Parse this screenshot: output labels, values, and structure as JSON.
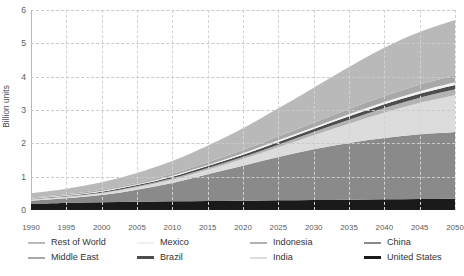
{
  "chart_data": {
    "type": "area",
    "title": "",
    "xlabel": "",
    "ylabel": "Billion units",
    "xlim": [
      1990,
      2050
    ],
    "ylim": [
      0,
      6
    ],
    "ytick_labels": [
      "0",
      "1",
      "2",
      "3",
      "4",
      "5",
      "6"
    ],
    "ytick_values": [
      0,
      1,
      2,
      3,
      4,
      5,
      6
    ],
    "x": [
      1990,
      1995,
      2000,
      2005,
      2010,
      2015,
      2020,
      2025,
      2030,
      2035,
      2040,
      2045,
      2050
    ],
    "xtick_labels": [
      "1990",
      "1995",
      "2000",
      "2005",
      "2010",
      "2015",
      "2020",
      "2025",
      "2030",
      "2035",
      "2040",
      "2045",
      "2050"
    ],
    "stacked": true,
    "grid": "dashed-both",
    "legend_position": "bottom",
    "series": [
      {
        "name": "United States",
        "color": "#1a1a1a",
        "values": [
          0.19,
          0.21,
          0.23,
          0.25,
          0.26,
          0.27,
          0.28,
          0.29,
          0.3,
          0.31,
          0.32,
          0.33,
          0.34
        ]
      },
      {
        "name": "China",
        "color": "#8a8a8a",
        "values": [
          0.09,
          0.14,
          0.22,
          0.36,
          0.55,
          0.8,
          1.05,
          1.3,
          1.52,
          1.7,
          1.84,
          1.94,
          2.0
        ]
      },
      {
        "name": "India",
        "color": "#dcdcdc",
        "values": [
          0.03,
          0.04,
          0.05,
          0.07,
          0.1,
          0.14,
          0.2,
          0.29,
          0.42,
          0.58,
          0.76,
          0.94,
          1.1
        ]
      },
      {
        "name": "Indonesia",
        "color": "#b3b3b3",
        "values": [
          0.01,
          0.02,
          0.02,
          0.03,
          0.04,
          0.05,
          0.06,
          0.08,
          0.1,
          0.12,
          0.14,
          0.16,
          0.18
        ]
      },
      {
        "name": "Brazil",
        "color": "#4d4d4d",
        "values": [
          0.02,
          0.02,
          0.03,
          0.04,
          0.05,
          0.06,
          0.07,
          0.08,
          0.09,
          0.1,
          0.11,
          0.12,
          0.13
        ]
      },
      {
        "name": "Mexico",
        "color": "#f2f2f2",
        "values": [
          0.01,
          0.01,
          0.02,
          0.02,
          0.03,
          0.03,
          0.04,
          0.05,
          0.05,
          0.06,
          0.07,
          0.07,
          0.08
        ]
      },
      {
        "name": "Middle East",
        "color": "#a8a8a8",
        "values": [
          0.02,
          0.03,
          0.04,
          0.05,
          0.06,
          0.08,
          0.1,
          0.12,
          0.14,
          0.16,
          0.18,
          0.2,
          0.22
        ]
      },
      {
        "name": "Rest of World",
        "color": "#b9b9b9",
        "values": [
          0.13,
          0.17,
          0.22,
          0.29,
          0.38,
          0.5,
          0.65,
          0.84,
          1.05,
          1.26,
          1.45,
          1.58,
          1.65
        ]
      }
    ],
    "totals": [
      0.5,
      0.64,
      0.83,
      1.11,
      1.47,
      1.93,
      2.45,
      3.05,
      3.67,
      4.29,
      4.87,
      5.34,
      5.7
    ]
  },
  "legend": {
    "columns": [
      {
        "entries": [
          {
            "label": "Rest of World",
            "color": "#b9b9b9",
            "weight": "normal"
          },
          {
            "label": "Middle East",
            "color": "#a8a8a8",
            "weight": "normal"
          }
        ]
      },
      {
        "entries": [
          {
            "label": "Mexico",
            "color": "#f0f0f0",
            "weight": "normal"
          },
          {
            "label": "Brazil",
            "color": "#4d4d4d",
            "weight": "thick"
          }
        ]
      },
      {
        "entries": [
          {
            "label": "Indonesia",
            "color": "#b3b3b3",
            "weight": "normal"
          },
          {
            "label": "India",
            "color": "#dcdcdc",
            "weight": "normal"
          }
        ]
      },
      {
        "entries": [
          {
            "label": "China",
            "color": "#8a8a8a",
            "weight": "normal"
          },
          {
            "label": "United States",
            "color": "#1a1a1a",
            "weight": "thick"
          }
        ]
      }
    ]
  }
}
